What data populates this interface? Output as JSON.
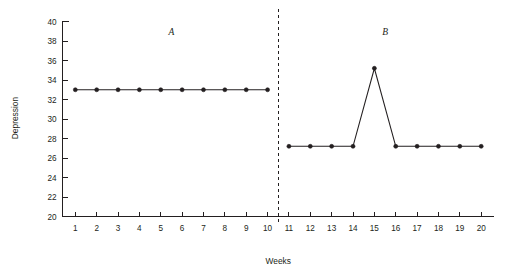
{
  "chart_data": {
    "type": "line",
    "title": "",
    "xlabel": "Weeks",
    "ylabel": "Depression",
    "xlim": [
      0.4,
      20.6
    ],
    "ylim": [
      20,
      40
    ],
    "grid": false,
    "legend": null,
    "x": [
      1,
      2,
      3,
      4,
      5,
      6,
      7,
      8,
      9,
      10,
      11,
      12,
      13,
      14,
      15,
      16,
      17,
      18,
      19,
      20
    ],
    "xtick_labels": [
      "1",
      "2",
      "3",
      "4",
      "5",
      "6",
      "7",
      "8",
      "9",
      "10",
      "11",
      "12",
      "13",
      "14",
      "15",
      "16",
      "17",
      "18",
      "19",
      "20"
    ],
    "ytick_labels": [
      "20",
      "22",
      "24",
      "26",
      "28",
      "30",
      "32",
      "34",
      "36",
      "38",
      "40"
    ],
    "ytick_values": [
      20,
      22,
      24,
      26,
      28,
      30,
      32,
      34,
      36,
      38,
      40
    ],
    "series": [
      {
        "name": "Phase A (baseline)",
        "x": [
          1,
          2,
          3,
          4,
          5,
          6,
          7,
          8,
          9,
          10
        ],
        "values": [
          33,
          33,
          33,
          33,
          33,
          33,
          33,
          33,
          33,
          33
        ]
      },
      {
        "name": "Phase B (intervention)",
        "x": [
          11,
          12,
          13,
          14,
          15,
          16,
          17,
          18,
          19,
          20
        ],
        "values": [
          27.2,
          27.2,
          27.2,
          27.2,
          35.2,
          27.2,
          27.2,
          27.2,
          27.2,
          27.2
        ]
      }
    ],
    "annotations": [
      {
        "text": "A",
        "x": 5.5,
        "y": 38.6,
        "style": "italic"
      },
      {
        "text": "B",
        "x": 15.5,
        "y": 38.6,
        "style": "italic"
      }
    ],
    "phase_divider": {
      "x": 10.5,
      "style": "dashed"
    },
    "colors": {
      "line": "#231f20",
      "marker": "#231f20",
      "axis": "#231f20",
      "background": "#ffffff"
    }
  },
  "labels": {
    "y_axis_title": "Depression",
    "x_axis_title": "Weeks",
    "phase_a": "A",
    "phase_b": "B"
  }
}
